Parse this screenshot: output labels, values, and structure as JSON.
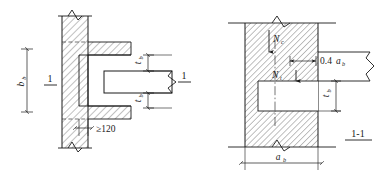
{
  "figure": {
    "title_implicit": "Beam embedded in wall — elevation and section detail",
    "colors": {
      "line": "#1a1a1a",
      "hatch": "#555555",
      "background": "#ffffff"
    }
  },
  "left_view": {
    "name": "elevation-view",
    "section_mark_left": "1",
    "section_mark_right": "1",
    "wall_height_label": "b",
    "wall_height_label_sub": "b",
    "beam_thickness_top_label": "t",
    "beam_thickness_top_label_sub": "b",
    "beam_thickness_bottom_label": "t",
    "beam_thickness_bottom_label_sub": "b",
    "min_bearing_label": "≥120"
  },
  "right_view": {
    "name": "section-view",
    "section_title": "1-1",
    "force_top_label": "N",
    "force_top_label_sub": "c",
    "force_bottom_label": "N",
    "force_bottom_label_sub": "t",
    "eccentricity_label": "0.4",
    "eccentricity_label_var": "a",
    "eccentricity_label_sub": "b",
    "beam_depth_label": "t",
    "beam_depth_label_sub": "b",
    "wall_thickness_label": "a",
    "wall_thickness_label_sub": "b"
  }
}
